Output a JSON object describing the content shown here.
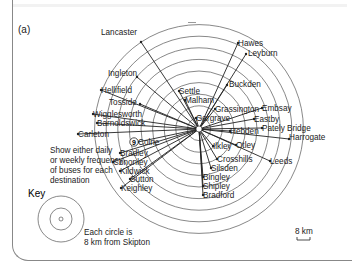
{
  "panel_label": "(a)",
  "center": "Skipton",
  "destinations": [
    {
      "name": "Lancaster",
      "x": 130,
      "y": 35,
      "ex": 141,
      "ey": 42,
      "anchor": "start",
      "lx": 101,
      "ly": 35
    },
    {
      "name": "Hawes",
      "x": 238,
      "y": 46,
      "anchor": "start"
    },
    {
      "name": "Leyburn",
      "x": 248,
      "y": 56,
      "ex": 246,
      "ey": 54,
      "anchor": "start"
    },
    {
      "name": "Ingleton",
      "x": 108,
      "y": 76,
      "ex": 137,
      "ey": 77,
      "anchor": "start"
    },
    {
      "name": "Buckden",
      "x": 229,
      "y": 87,
      "ex": 227,
      "ey": 85,
      "anchor": "start"
    },
    {
      "name": "Hellifield",
      "x": 101,
      "y": 93,
      "anchor": "start"
    },
    {
      "name": "Settle",
      "x": 179,
      "y": 94,
      "anchor": "start"
    },
    {
      "name": "Malham",
      "x": 185,
      "y": 103,
      "anchor": "start"
    },
    {
      "name": "Tosside",
      "x": 109,
      "y": 105,
      "ex": 140,
      "ey": 104,
      "anchor": "start"
    },
    {
      "name": "Grassington",
      "x": 215,
      "y": 112,
      "anchor": "start"
    },
    {
      "name": "Embsay",
      "x": 262,
      "y": 111,
      "anchor": "start"
    },
    {
      "name": "Wigglesworth",
      "x": 93,
      "y": 117,
      "anchor": "start"
    },
    {
      "name": "Gargrave",
      "x": 196,
      "y": 121,
      "anchor": "start"
    },
    {
      "name": "Barnoldswick",
      "x": 97,
      "y": 126,
      "anchor": "start"
    },
    {
      "name": "Eastby",
      "x": 254,
      "y": 122,
      "anchor": "start"
    },
    {
      "name": "Carleton",
      "x": 78,
      "y": 137,
      "anchor": "start"
    },
    {
      "name": "Hebden",
      "x": 230,
      "y": 134,
      "anchor": "start"
    },
    {
      "name": "Pately Bridge",
      "x": 262,
      "y": 131,
      "anchor": "start"
    },
    {
      "name": "Harrogate",
      "x": 289,
      "y": 140,
      "ex": 289,
      "ey": 139,
      "anchor": "start"
    },
    {
      "name": "Colne",
      "x": 138,
      "y": 145,
      "anchor": "start"
    },
    {
      "name": "Ilkley",
      "x": 213,
      "y": 149,
      "anchor": "start"
    },
    {
      "name": "Otley",
      "x": 236,
      "y": 148,
      "anchor": "start"
    },
    {
      "name": "Leeds",
      "x": 270,
      "y": 164,
      "ex": 270,
      "ey": 161,
      "anchor": "start"
    },
    {
      "name": "Bradley",
      "x": 120,
      "y": 156,
      "anchor": "start"
    },
    {
      "name": "Crosshills",
      "x": 217,
      "y": 162,
      "anchor": "start"
    },
    {
      "name": "Cononley",
      "x": 113,
      "y": 165,
      "anchor": "start"
    },
    {
      "name": "Silsden",
      "x": 211,
      "y": 171,
      "anchor": "start"
    },
    {
      "name": "Kildwick",
      "x": 120,
      "y": 174,
      "anchor": "start"
    },
    {
      "name": "Bingley",
      "x": 203,
      "y": 180,
      "anchor": "start"
    },
    {
      "name": "Sutton",
      "x": 130,
      "y": 182,
      "anchor": "start"
    },
    {
      "name": "Shipley",
      "x": 203,
      "y": 189,
      "anchor": "start"
    },
    {
      "name": "Keighley",
      "x": 121,
      "y": 191,
      "anchor": "start"
    },
    {
      "name": "Bradford",
      "x": 203,
      "y": 198,
      "anchor": "start"
    }
  ],
  "example_badge": "9",
  "instruction": [
    "Show either daily",
    "or weekly frequency",
    "of buses for each",
    "destination"
  ],
  "key": {
    "title": "Key",
    "note": [
      "Each circle is",
      "8 km from Skipton"
    ]
  },
  "scale": {
    "label": "8 km"
  }
}
